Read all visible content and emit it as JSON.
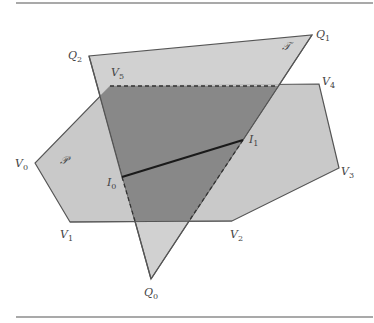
{
  "figure": {
    "colors": {
      "light": "#c9c9c9",
      "dark": "#888888",
      "edge": "#555555",
      "segment": "#1a1a1a"
    },
    "polygon_P": {
      "name": "𝒫",
      "vertices": [
        {
          "label": "V",
          "sub": "0",
          "x": 35,
          "y": 163
        },
        {
          "label": "V",
          "sub": "1",
          "x": 70,
          "y": 222
        },
        {
          "label": "V",
          "sub": "2",
          "x": 232,
          "y": 221
        },
        {
          "label": "V",
          "sub": "3",
          "x": 339,
          "y": 168
        },
        {
          "label": "V",
          "sub": "4",
          "x": 319,
          "y": 84
        },
        {
          "label": "V",
          "sub": "5",
          "x": 110,
          "y": 86
        }
      ]
    },
    "triangle_T": {
      "name": "𝒯",
      "vertices": [
        {
          "label": "Q",
          "sub": "0",
          "x": 151,
          "y": 279
        },
        {
          "label": "Q",
          "sub": "1",
          "x": 312,
          "y": 35
        },
        {
          "label": "Q",
          "sub": "2",
          "x": 89,
          "y": 56
        }
      ]
    },
    "intersection_points": [
      {
        "label": "I",
        "sub": "0",
        "x": 122,
        "y": 177
      },
      {
        "label": "I",
        "sub": "1",
        "x": 243,
        "y": 140
      }
    ]
  }
}
